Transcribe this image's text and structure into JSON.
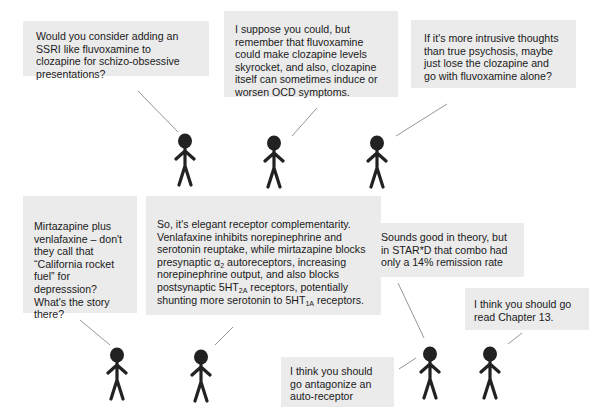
{
  "diagram": {
    "type": "stick-figure-dialogue",
    "rows": [
      {
        "bubbles": [
          {
            "id": "b1",
            "text": "Would you consider adding an SSRI like fluvoxamine to clozapine for schizo-obsessive presentations?"
          },
          {
            "id": "b2",
            "text": "I suppose you could, but remember that fluvoxamine could make clozapine levels skyrocket, and also, clozapine itself can sometimes induce or worsen OCD symptoms."
          },
          {
            "id": "b3",
            "text": "If it's more intrusive thoughts than true psychosis, maybe just lose the clozapine and go with fluvoxamine alone?"
          }
        ],
        "figures": 3
      },
      {
        "bubbles": [
          {
            "id": "b4",
            "text": "Mirtazapine plus venlafaxine – don't they call that “California rocket fuel” for depresssion? What's the story there?"
          },
          {
            "id": "b5",
            "text_part1": "So, it's elegant receptor complementarity. Venlafaxine inhibits norepinephrine and serotonin reuptake, while mirtazapine blocks presynaptic α",
            "sub1": "2",
            "text_part2": " autoreceptors, increasing norepinephrine output, and also blocks postsynaptic 5HT",
            "sub2": "2A",
            "text_part3": " receptors, potentially shunting more serotonin to 5HT",
            "sub3": "1A",
            "text_part4": " receptors."
          },
          {
            "id": "b6",
            "text": "Sounds good in theory, but in STAR*D that combo had only a 14% remission rate"
          },
          {
            "id": "b7",
            "text": "I think you should go read Chapter 13."
          },
          {
            "id": "b8",
            "text": "I think you should go antagonize an auto-receptor"
          }
        ],
        "figures": 4
      }
    ],
    "colors": {
      "bubble_bg": "#ebebeb",
      "figure": "#222222",
      "pointer": "#888888"
    }
  }
}
